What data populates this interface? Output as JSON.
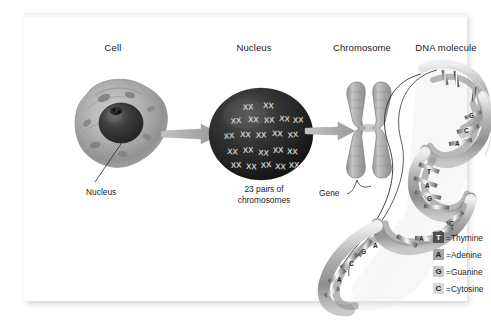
{
  "figure": {
    "title_sequence": "Cell to DNA molecule",
    "headers": [
      {
        "label": "Cell",
        "name": "header-cell"
      },
      {
        "label": "Nucleus",
        "name": "header-nucleus"
      },
      {
        "label": "Chromosome",
        "name": "header-chromosome"
      },
      {
        "label": "DNA molecule",
        "name": "header-dna-molecule"
      }
    ],
    "callouts": {
      "nucleus": "Nucleus",
      "gene": "Gene"
    },
    "captions": {
      "chromosome_count": "23 pairs of\nchromosomes"
    },
    "legend": {
      "items": [
        {
          "symbol": "T",
          "equals": "=Thymine",
          "base": "Thymine",
          "tile_bg": "#4e4e4e",
          "tile_fg": "#ffffff"
        },
        {
          "symbol": "A",
          "equals": "=Adenine",
          "base": "Adenine",
          "tile_bg": "#a6a6a6",
          "tile_fg": "#1c1c1c"
        },
        {
          "symbol": "G",
          "equals": "=Guanine",
          "base": "Guanine",
          "tile_bg": "#c9c9c9",
          "tile_fg": "#1c1c1c"
        },
        {
          "symbol": "C",
          "equals": "=Cytosine",
          "base": "Cytosine",
          "tile_bg": "#d8d8d8",
          "tile_fg": "#1c1c1c"
        }
      ]
    },
    "dna_bases_on_helix": [
      "C",
      "G",
      "A",
      "T",
      "G",
      "C",
      "A",
      "T",
      "G",
      "C",
      "A",
      "C",
      "G",
      "A",
      "C",
      "G"
    ],
    "colors": {
      "background": "#ffffff",
      "ink": "#1a1a1a",
      "arrow": "#9a9a9a",
      "nucleus_dark": "#2b2b2b",
      "cell_gray": "#9e9e9e",
      "helix_gray": "#b5b5b5"
    }
  }
}
